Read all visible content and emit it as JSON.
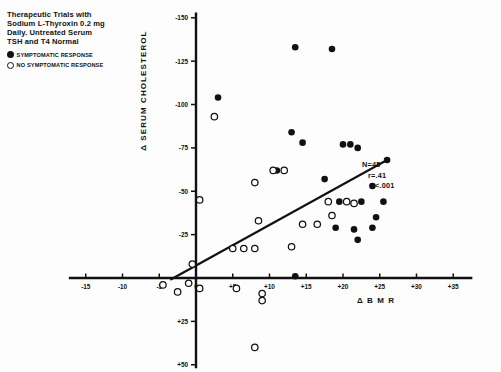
{
  "title": {
    "lines": [
      "Therapeutic Trials with",
      "Sodium L-Thyroxin 0.2 mg",
      "Daily.  Untreated Serum",
      "TSH and T4 Normal"
    ]
  },
  "legend": {
    "position": "top-left",
    "items": [
      {
        "marker": "filled-circle-icon",
        "label": "SYMPTOMATIC RESPONSE"
      },
      {
        "marker": "open-circle-icon",
        "label": "NO SYMPTOMATIC RESPONSE"
      }
    ]
  },
  "stats": {
    "n": "N=45",
    "r": "r=.41",
    "p": "P<.001"
  },
  "colors": {
    "ink": "#111111",
    "background": "#ffffff",
    "marker_filled": "#111111",
    "marker_open_stroke": "#111111"
  },
  "chart_data": {
    "type": "scatter",
    "title": "Therapeutic Trials with Sodium L-Thyroxin 0.2 mg Daily.  Untreated Serum TSH and T4 Normal",
    "xlabel": "Δ B M R",
    "ylabel": "Δ SERUM CHOLESTEROL",
    "grid": false,
    "legend_position": "top-left",
    "xlim": [
      -18,
      38
    ],
    "ylim": [
      -155,
      55
    ],
    "y_inverted": true,
    "xticks": [
      -15,
      -10,
      -5,
      0,
      5,
      10,
      15,
      20,
      25,
      30,
      35
    ],
    "xtick_labels": [
      "-15",
      "-10",
      "-5",
      "0",
      "+5",
      "+10",
      "+15",
      "+20",
      "+25",
      "+30",
      "+35"
    ],
    "yticks": [
      -150,
      -125,
      -100,
      -75,
      -50,
      -25,
      0,
      25,
      50
    ],
    "ytick_labels": [
      "-150",
      "-125",
      "-100",
      "-75",
      "-50",
      "-25",
      "0",
      "+25",
      "+50"
    ],
    "annotations": [
      "N=45",
      "r=.41",
      "P<.001"
    ],
    "regression_line": {
      "x0": -3.5,
      "y0": 1,
      "x1": 26,
      "y1": -68
    },
    "series": [
      {
        "name": "SYMPTOMATIC RESPONSE",
        "marker": "filled-circle",
        "points": [
          [
            3.0,
            -104
          ],
          [
            13.5,
            -133
          ],
          [
            18.5,
            -132
          ],
          [
            13.0,
            -84
          ],
          [
            14.5,
            -78
          ],
          [
            20.0,
            -77
          ],
          [
            21.0,
            -77
          ],
          [
            22.0,
            -75
          ],
          [
            26.0,
            -68
          ],
          [
            11.0,
            -62
          ],
          [
            17.5,
            -57
          ],
          [
            24.0,
            -53
          ],
          [
            19.5,
            -44
          ],
          [
            22.5,
            -44
          ],
          [
            25.5,
            -44
          ],
          [
            24.5,
            -35
          ],
          [
            19.0,
            -29
          ],
          [
            21.5,
            -28
          ],
          [
            24.0,
            -29
          ],
          [
            22.0,
            -22
          ],
          [
            13.5,
            -1
          ]
        ]
      },
      {
        "name": "NO SYMPTOMATIC RESPONSE",
        "marker": "open-circle",
        "points": [
          [
            2.5,
            -93
          ],
          [
            10.5,
            -62
          ],
          [
            12.0,
            -62
          ],
          [
            8.0,
            -55
          ],
          [
            0.5,
            -45
          ],
          [
            18.0,
            -44
          ],
          [
            20.5,
            -44
          ],
          [
            21.5,
            -43
          ],
          [
            18.5,
            -36
          ],
          [
            8.5,
            -33
          ],
          [
            14.5,
            -31
          ],
          [
            16.5,
            -31
          ],
          [
            5.0,
            -17
          ],
          [
            6.5,
            -17
          ],
          [
            8.0,
            -17
          ],
          [
            13.0,
            -18
          ],
          [
            -0.5,
            -8
          ],
          [
            -1.0,
            3
          ],
          [
            -4.5,
            4
          ],
          [
            0.5,
            6
          ],
          [
            -2.5,
            8
          ],
          [
            5.5,
            6
          ],
          [
            9.0,
            9
          ],
          [
            9.0,
            13
          ],
          [
            8.0,
            40
          ]
        ]
      }
    ]
  }
}
